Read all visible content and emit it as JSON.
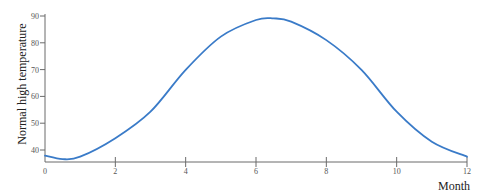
{
  "chart_data": {
    "type": "line",
    "title": "",
    "xlabel": "Month",
    "ylabel": "Normal high temperature",
    "xlim": [
      0,
      12
    ],
    "ylim": [
      35.5,
      90
    ],
    "grid": false,
    "legend": null,
    "x_ticks": [
      0,
      2,
      4,
      6,
      8,
      10,
      12
    ],
    "y_ticks": [
      40,
      50,
      60,
      70,
      80,
      90
    ],
    "series": [
      {
        "name": "Normal high temperature",
        "color": "#3a7bc8",
        "x": [
          0,
          0.5,
          1,
          2,
          3,
          4,
          5,
          6,
          6.5,
          7,
          8,
          9,
          10,
          11,
          12
        ],
        "values": [
          37.9,
          36.6,
          37.5,
          44.4,
          54.3,
          69.9,
          82.3,
          88.5,
          89.1,
          87.9,
          81.0,
          69.9,
          54.3,
          43.1,
          37.5
        ]
      }
    ]
  },
  "layout": {
    "plot_left": 45,
    "plot_right": 467,
    "y_at_90": 16,
    "y_at_40": 150,
    "x_axis_y": 162
  }
}
